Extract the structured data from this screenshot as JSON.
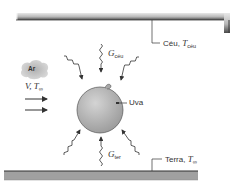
{
  "diagram": {
    "sky": {
      "label": "Céu, ",
      "temp_symbol": "T",
      "temp_sub": "céu"
    },
    "ground": {
      "label": "Terra, ",
      "temp_symbol": "T",
      "temp_sub": "∞"
    },
    "air": {
      "label": "Ar",
      "flow_v": "V, ",
      "flow_t": "T",
      "flow_t_sub": "∞"
    },
    "grape": {
      "label": "Uva"
    },
    "irradiation_sky": {
      "symbol": "G",
      "sub": "céu"
    },
    "irradiation_ground": {
      "symbol": "G",
      "sub": "ter"
    },
    "colors": {
      "bar_dark": "#5a5a5a",
      "bar_light": "#d8d8d8",
      "ground_fill": "#9a9a9a",
      "grape_fill": "#b5b5b5",
      "cloud_fill": "#c8c8c8",
      "line": "#333333"
    }
  }
}
